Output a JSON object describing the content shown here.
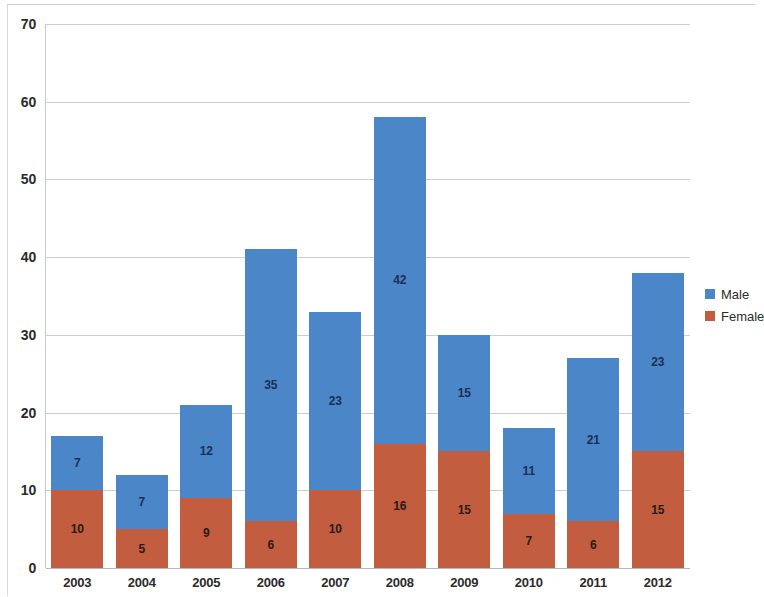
{
  "chart_data": {
    "type": "bar",
    "subtype": "stacked-column",
    "title": "",
    "xlabel": "",
    "ylabel": "",
    "categories": [
      "2003",
      "2004",
      "2005",
      "2006",
      "2007",
      "2008",
      "2009",
      "2010",
      "2011",
      "2012"
    ],
    "series": [
      {
        "name": "Female",
        "color": "#c25d40",
        "values": [
          10,
          5,
          9,
          6,
          10,
          16,
          15,
          7,
          6,
          15
        ]
      },
      {
        "name": "Male",
        "color": "#4a86c8",
        "values": [
          7,
          7,
          12,
          35,
          23,
          42,
          15,
          11,
          21,
          23
        ]
      }
    ],
    "totals": [
      17,
      12,
      21,
      41,
      33,
      58,
      30,
      18,
      27,
      38
    ],
    "ylim": [
      0,
      70
    ],
    "ytick_step": 10,
    "ytick_labels": [
      "0",
      "10",
      "20",
      "30",
      "40",
      "50",
      "60",
      "70"
    ],
    "grid": true,
    "data_labels": true,
    "legend": {
      "position": "right",
      "entries": [
        {
          "label": "Male",
          "color": "#4a86c8",
          "swatch": "male-swatch"
        },
        {
          "label": "Female",
          "color": "#c25d40",
          "swatch": "female-swatch"
        }
      ]
    }
  }
}
